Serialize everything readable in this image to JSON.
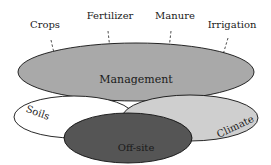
{
  "diagram": {
    "top_labels": [
      {
        "text": "Crops"
      },
      {
        "text": "Fertilizer"
      },
      {
        "text": "Manure"
      },
      {
        "text": "Irrigation"
      }
    ],
    "ellipses": {
      "management": {
        "label": "Management",
        "fill": "#a9a9a9"
      },
      "soils": {
        "label": "Soils",
        "fill": "#ffffff"
      },
      "climate": {
        "label": "Climate",
        "fill": "#cfcfcf"
      },
      "offsite": {
        "label": "Off-site",
        "fill": "#555555"
      }
    },
    "stroke": "#111111"
  }
}
